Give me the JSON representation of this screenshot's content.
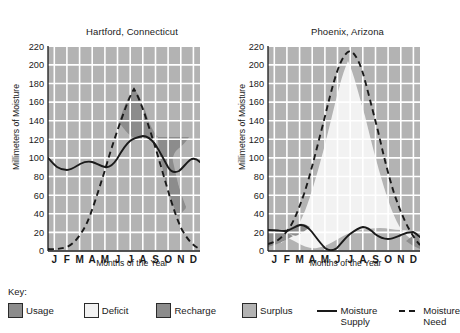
{
  "figure": {
    "ylabel": "Millimeters of Moisture",
    "xlabel": "Months of the Year",
    "key_title": "Key:"
  },
  "legend": {
    "items": [
      {
        "name": "usage",
        "label": "Usage",
        "color": "#8c8c8c",
        "type": "swatch"
      },
      {
        "name": "deficit",
        "label": "Deficit",
        "color": "#f2f2f2",
        "type": "swatch"
      },
      {
        "name": "recharge",
        "label": "Recharge",
        "color": "#8c8c8c",
        "type": "swatch"
      },
      {
        "name": "surplus",
        "label": "Surplus",
        "color": "#b3b3b3",
        "type": "swatch"
      },
      {
        "name": "moisture-supply",
        "label": "Moisture\nSupply",
        "color": "#1a1a1a",
        "type": "solid-line"
      },
      {
        "name": "moisture-need",
        "label": "Moisture\nNeed",
        "color": "#1a1a1a",
        "type": "dashed-line"
      }
    ]
  },
  "chart_data": [
    {
      "type": "line",
      "name": "hartford",
      "title": "Hartford, Connecticut",
      "xlabel": "Months of the Year",
      "ylabel": "Millimeters of Moisture",
      "ylim": [
        0,
        220
      ],
      "yticks": [
        0,
        20,
        40,
        60,
        80,
        100,
        120,
        140,
        160,
        180,
        200,
        220
      ],
      "categories": [
        "J",
        "F",
        "M",
        "A",
        "M",
        "J",
        "J",
        "A",
        "S",
        "O",
        "N",
        "D"
      ],
      "grid": true,
      "legend_position": "bottom-shared",
      "series": [
        {
          "name": "Moisture Supply",
          "style": "solid",
          "values": [
            100,
            86,
            85,
            93,
            89,
            88,
            97,
            105,
            98,
            83,
            86,
            96
          ]
        },
        {
          "name": "Moisture Need",
          "style": "dashed",
          "values": [
            2,
            2,
            6,
            28,
            72,
            122,
            147,
            130,
            88,
            46,
            18,
            3
          ]
        }
      ],
      "regions": [
        {
          "name": "usage",
          "months": "June - August",
          "fill": "#8c8c8c"
        },
        {
          "name": "recharge",
          "months": "September - November",
          "fill": "#8c8c8c"
        },
        {
          "name": "surplus",
          "months": "December - May",
          "fill": "#b3b3b3"
        }
      ]
    },
    {
      "type": "line",
      "name": "phoenix",
      "title": "Phoenix, Arizona",
      "xlabel": "Months of the Year",
      "ylabel": "Millimeters of Moisture",
      "ylim": [
        0,
        220
      ],
      "yticks": [
        0,
        20,
        40,
        60,
        80,
        100,
        120,
        140,
        160,
        180,
        200,
        220
      ],
      "categories": [
        "J",
        "F",
        "M",
        "A",
        "M",
        "J",
        "J",
        "A",
        "S",
        "O",
        "N",
        "D"
      ],
      "grid": true,
      "legend_position": "bottom-shared",
      "series": [
        {
          "name": "Moisture Supply",
          "style": "solid",
          "values": [
            22,
            22,
            19,
            11,
            3,
            0,
            16,
            26,
            23,
            16,
            15,
            22
          ]
        },
        {
          "name": "Moisture Need",
          "style": "dashed",
          "values": [
            8,
            14,
            30,
            66,
            120,
            178,
            213,
            198,
            150,
            86,
            36,
            9
          ]
        }
      ],
      "regions": [
        {
          "name": "usage",
          "months": "January - February",
          "fill": "#8c8c8c"
        },
        {
          "name": "recharge",
          "months": "February - March",
          "fill": "#8c8c8c"
        },
        {
          "name": "usage-end",
          "months": "November - December",
          "fill": "#8c8c8c"
        },
        {
          "name": "deficit",
          "months": "March - November",
          "fill": "#f2f2f2"
        }
      ]
    }
  ]
}
